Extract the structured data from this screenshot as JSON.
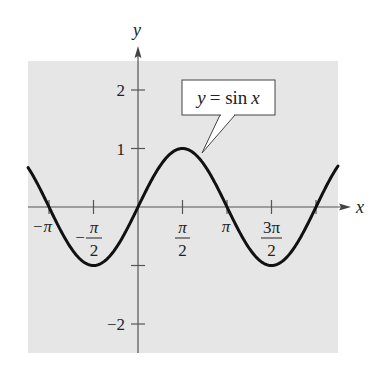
{
  "chart_data": {
    "type": "line",
    "title": "",
    "xlabel": "x",
    "ylabel": "y",
    "series": [
      {
        "name": "y = sin x",
        "function": "sin(x)",
        "x_range": [
          -3.88,
          7.06
        ],
        "x": [
          -3.1416,
          -1.5708,
          0,
          1.5708,
          3.1416,
          4.7124,
          6.2832
        ],
        "values": [
          0,
          -1,
          0,
          1,
          0,
          -1,
          0
        ]
      }
    ],
    "x_ticks": [
      {
        "label": "−π",
        "value": -3.1416
      },
      {
        "label": "−π/2",
        "value": -1.5708
      },
      {
        "label": "π/2",
        "value": 1.5708
      },
      {
        "label": "π",
        "value": 3.1416
      },
      {
        "label": "3π/2",
        "value": 4.7124
      }
    ],
    "y_ticks": [
      {
        "label": "2",
        "value": 2
      },
      {
        "label": "1",
        "value": 1
      },
      {
        "label": "−1",
        "value": -1,
        "unlabeled": true
      },
      {
        "label": "−2",
        "value": -2
      }
    ],
    "xlim": [
      -3.88,
      7.06
    ],
    "ylim": [
      -2.5,
      2.5
    ],
    "grid": false,
    "annotation": "y = sin x",
    "background": "#e6e6e6",
    "curve_color": "#111111"
  },
  "labels": {
    "x_axis": "x",
    "y_axis": "y",
    "annotation_y": "y",
    "annotation_eq": "= sin",
    "annotation_x": "x",
    "tick_neg_pi": "−π",
    "tick_pi": "π",
    "tick_pi_num": "π",
    "tick_3pi_num": "3π",
    "tick_den": "2",
    "tick_minus": "−",
    "y2": "2",
    "y1": "1",
    "ym2": "−2"
  }
}
